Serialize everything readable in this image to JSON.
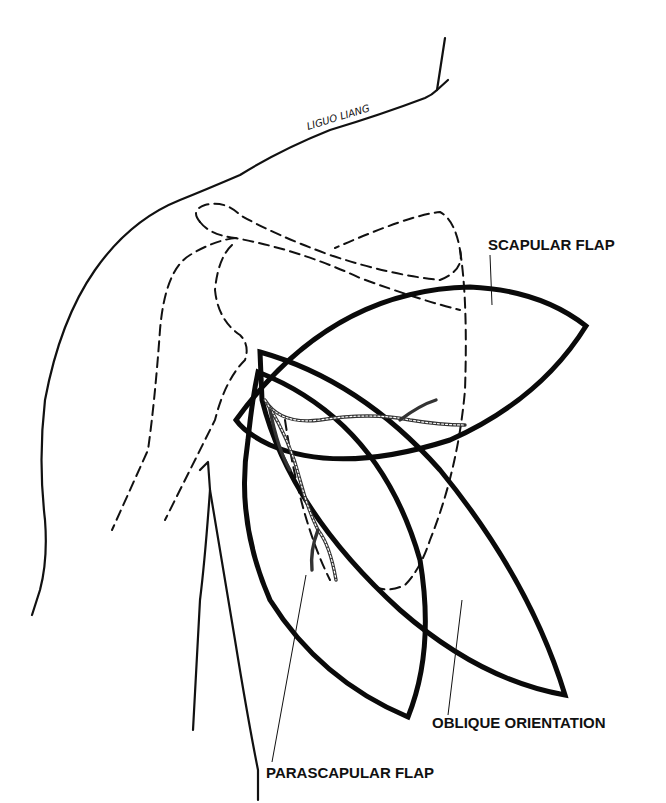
{
  "diagram": {
    "signature": "LIGUO LIANG",
    "labels": {
      "scapular_flap": "SCAPULAR FLAP",
      "oblique_orientation": "OBLIQUE ORIENTATION",
      "parascapular_flap": "PARASCAPULAR FLAP"
    },
    "colors": {
      "line": "#111111",
      "background": "#ffffff"
    }
  }
}
